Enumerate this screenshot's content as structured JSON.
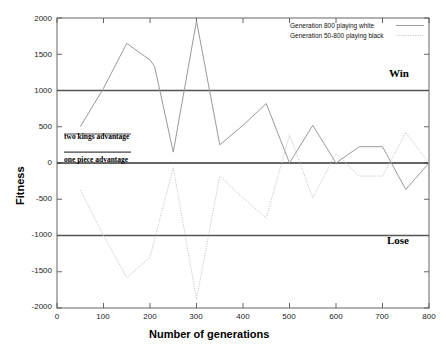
{
  "chart_data": {
    "type": "line",
    "title": "",
    "xlabel": "Number of generations",
    "ylabel": "Fitness",
    "xlim": [
      0,
      800
    ],
    "ylim": [
      -2000,
      2000
    ],
    "xticks": [
      0,
      100,
      200,
      300,
      400,
      500,
      600,
      700,
      800
    ],
    "yticks": [
      2000,
      1500,
      1000,
      500,
      0,
      -500,
      -1000,
      -1500,
      -2000
    ],
    "grid": false,
    "legend_position": "top-right",
    "series": [
      {
        "name": "Generation 800 playing white",
        "style": "solid",
        "color": "#9a9a9a",
        "x": [
          50,
          100,
          150,
          200,
          210,
          250,
          300,
          350,
          400,
          450,
          500,
          550,
          600,
          650,
          700,
          750,
          800
        ],
        "y": [
          500,
          1030,
          1650,
          1420,
          1330,
          150,
          1960,
          250,
          520,
          820,
          0,
          520,
          0,
          225,
          225,
          -365,
          0
        ]
      },
      {
        "name": "Generation 50-800 playing black",
        "style": "dotted",
        "color": "#c8c8c8",
        "x": [
          50,
          100,
          150,
          200,
          250,
          300,
          350,
          400,
          450,
          500,
          550,
          600,
          650,
          700,
          750,
          800
        ],
        "y": [
          -370,
          -1000,
          -1580,
          -1300,
          -60,
          -1880,
          -180,
          -480,
          -760,
          390,
          -480,
          130,
          -180,
          -180,
          420,
          0
        ]
      }
    ],
    "reference_lines": [
      {
        "name": "win-threshold",
        "y": 1000,
        "label": "Win",
        "color": "#555555"
      },
      {
        "name": "zero-line",
        "y": 0,
        "label": "",
        "color": "#333333"
      },
      {
        "name": "lose-threshold",
        "y": -1000,
        "label": "Lose",
        "color": "#555555"
      }
    ],
    "annotations": [
      {
        "name": "two-kings-advantage",
        "text": "two kings advantage",
        "y": 400,
        "x": 30
      },
      {
        "name": "one-piece-advantage",
        "text": "one piece advantage",
        "y": 150,
        "x": 30
      }
    ]
  },
  "axes": {
    "ylabel": "Fitness",
    "xlabel": "Number of generations",
    "yticks": [
      "2000",
      "1500",
      "1000",
      "500",
      "0",
      "-500",
      "-1000",
      "-1500",
      "-2000"
    ],
    "xticks": [
      "0",
      "100",
      "200",
      "300",
      "400",
      "500",
      "600",
      "700",
      "800"
    ]
  },
  "legend": {
    "entries": [
      {
        "label": "Generation 800 playing white",
        "style": "solid"
      },
      {
        "label": "Generation 50-800 playing black",
        "style": "dotted"
      }
    ]
  },
  "region_labels": {
    "win": "Win",
    "lose": "Lose"
  },
  "annotations": {
    "two_kings": "two kings advantage",
    "one_piece": "one piece advantage"
  },
  "colors": {
    "white_series": "#9a9a9a",
    "black_series": "#c8c8c8",
    "reference": "#555555",
    "zero": "#333333",
    "axis": "#555555",
    "text": "#000000"
  }
}
